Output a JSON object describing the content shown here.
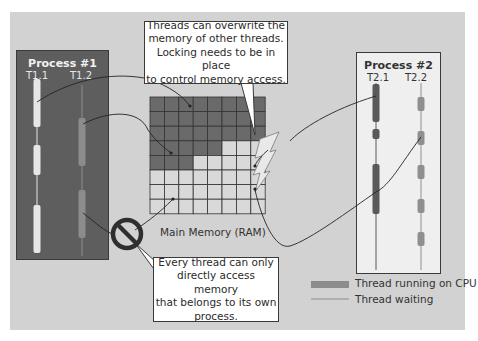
{
  "process1": {
    "title": "Process #1",
    "threads": [
      {
        "label": "T1.1"
      },
      {
        "label": "T1.2"
      }
    ]
  },
  "process2": {
    "title": "Process #2",
    "threads": [
      {
        "label": "T2.1"
      },
      {
        "label": "T2.2"
      }
    ]
  },
  "callout_top": {
    "lines": [
      "Threads can overwrite the",
      "memory of other threads.",
      "Locking needs to be in place",
      "to control memory access."
    ]
  },
  "callout_bottom": {
    "lines": [
      "Every thread can only",
      "directly access memory",
      "that belongs to its own",
      "process."
    ]
  },
  "memory": {
    "label": "Main Memory (RAM)",
    "rows": 8,
    "cols": 8,
    "dark_cells_per_row": [
      8,
      8,
      8,
      5,
      3,
      0,
      0,
      0
    ]
  },
  "legend": {
    "running_label": "Thread running on CPU",
    "waiting_label": "Thread waiting"
  },
  "icons": {
    "forbidden": "no-entry-icon",
    "conflict": "lightning-bolt-icon"
  },
  "colors": {
    "panel": "#d2d2d2",
    "process1_bg": "#5e5e5e",
    "process2_bg": "#efefef",
    "memory_dark": "#6a6a6a",
    "memory_light": "#d9d9d9",
    "thread_t11": "#e6e6e6",
    "thread_t12": "#8c8c8c",
    "thread_t21": "#595959",
    "thread_t22": "#8f8f8f"
  }
}
